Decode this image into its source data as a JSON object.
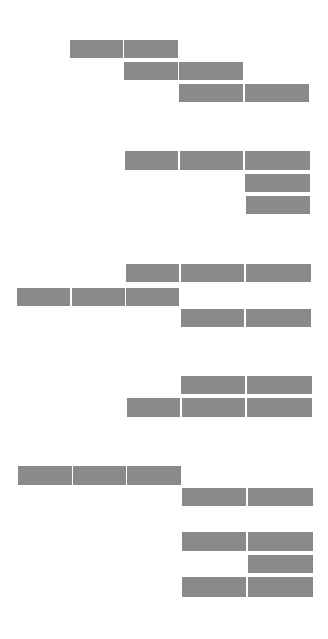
{
  "colors": {
    "background": "#ffffff",
    "block_fill": "#8a8a8a"
  },
  "groups": [
    {
      "name": "group-1",
      "blocks": [
        {
          "x": 70,
          "y": 40,
          "w": 53,
          "h": 18
        },
        {
          "x": 124,
          "y": 40,
          "w": 54,
          "h": 18
        },
        {
          "x": 124,
          "y": 62,
          "w": 54,
          "h": 18
        },
        {
          "x": 179,
          "y": 62,
          "w": 64,
          "h": 18
        },
        {
          "x": 179,
          "y": 84,
          "w": 64,
          "h": 18
        },
        {
          "x": 245,
          "y": 84,
          "w": 64,
          "h": 18
        }
      ]
    },
    {
      "name": "group-2",
      "blocks": [
        {
          "x": 125,
          "y": 151,
          "w": 53,
          "h": 19
        },
        {
          "x": 180,
          "y": 151,
          "w": 63,
          "h": 19
        },
        {
          "x": 245,
          "y": 151,
          "w": 65,
          "h": 19
        },
        {
          "x": 245,
          "y": 174,
          "w": 65,
          "h": 18
        },
        {
          "x": 246,
          "y": 196,
          "w": 64,
          "h": 18
        }
      ]
    },
    {
      "name": "group-3",
      "blocks": [
        {
          "x": 126,
          "y": 264,
          "w": 53,
          "h": 18
        },
        {
          "x": 181,
          "y": 264,
          "w": 63,
          "h": 18
        },
        {
          "x": 246,
          "y": 264,
          "w": 65,
          "h": 18
        },
        {
          "x": 17,
          "y": 288,
          "w": 53,
          "h": 18
        },
        {
          "x": 72,
          "y": 288,
          "w": 53,
          "h": 18
        },
        {
          "x": 126,
          "y": 288,
          "w": 53,
          "h": 18
        },
        {
          "x": 181,
          "y": 309,
          "w": 63,
          "h": 18
        },
        {
          "x": 246,
          "y": 309,
          "w": 65,
          "h": 18
        }
      ]
    },
    {
      "name": "group-4",
      "blocks": [
        {
          "x": 181,
          "y": 376,
          "w": 64,
          "h": 18
        },
        {
          "x": 247,
          "y": 376,
          "w": 65,
          "h": 18
        },
        {
          "x": 127,
          "y": 398,
          "w": 53,
          "h": 19
        },
        {
          "x": 182,
          "y": 398,
          "w": 63,
          "h": 19
        },
        {
          "x": 247,
          "y": 398,
          "w": 65,
          "h": 19
        }
      ]
    },
    {
      "name": "group-5",
      "blocks": [
        {
          "x": 18,
          "y": 466,
          "w": 54,
          "h": 19
        },
        {
          "x": 73,
          "y": 466,
          "w": 53,
          "h": 19
        },
        {
          "x": 127,
          "y": 466,
          "w": 54,
          "h": 19
        },
        {
          "x": 182,
          "y": 488,
          "w": 64,
          "h": 18
        },
        {
          "x": 248,
          "y": 488,
          "w": 65,
          "h": 18
        }
      ]
    },
    {
      "name": "group-6",
      "blocks": [
        {
          "x": 182,
          "y": 532,
          "w": 64,
          "h": 19
        },
        {
          "x": 248,
          "y": 532,
          "w": 65,
          "h": 19
        },
        {
          "x": 248,
          "y": 555,
          "w": 65,
          "h": 18
        },
        {
          "x": 182,
          "y": 577,
          "w": 64,
          "h": 20
        },
        {
          "x": 248,
          "y": 577,
          "w": 65,
          "h": 20
        }
      ]
    }
  ]
}
